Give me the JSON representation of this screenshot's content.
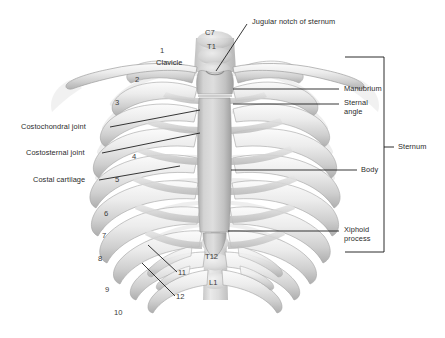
{
  "figure": {
    "background_color": "#ffffff",
    "bone_light": "#f2f2f2",
    "bone_mid": "#d8d8d8",
    "bone_shadow": "#b6b6b6",
    "line_color": "#1c1c1c",
    "text_color": "#2a2a2a"
  },
  "labels": {
    "jugular_notch": "Jugular notch of sternum",
    "clavicle": "Clavicle",
    "costochondral_joint": "Costochondral joint",
    "costosternal_joint": "Costosternal joint",
    "costal_cartilage": "Costal cartilage",
    "manubrium": "Manubrium",
    "sternal_angle_line1": "Sternal",
    "sternal_angle_line2": "angle",
    "body": "Body",
    "xiphoid_line1": "Xiphoid",
    "xiphoid_line2": "process",
    "sternum_bracket": "Sternum"
  },
  "vertebrae": [
    {
      "name": "c7",
      "text": "C7"
    },
    {
      "name": "t1",
      "text": "T1"
    },
    {
      "name": "t12",
      "text": "T12"
    },
    {
      "name": "l1",
      "text": "L1"
    }
  ],
  "rib_numbers": [
    {
      "name": "rib-1",
      "text": "1"
    },
    {
      "name": "rib-2",
      "text": "2"
    },
    {
      "name": "rib-3",
      "text": "3"
    },
    {
      "name": "rib-4",
      "text": "4"
    },
    {
      "name": "rib-5",
      "text": "5"
    },
    {
      "name": "rib-6",
      "text": "6"
    },
    {
      "name": "rib-7",
      "text": "7"
    },
    {
      "name": "rib-8",
      "text": "8"
    },
    {
      "name": "rib-9",
      "text": "9"
    },
    {
      "name": "rib-10",
      "text": "10"
    },
    {
      "name": "rib-11",
      "text": "11"
    },
    {
      "name": "rib-12",
      "text": "12"
    }
  ]
}
